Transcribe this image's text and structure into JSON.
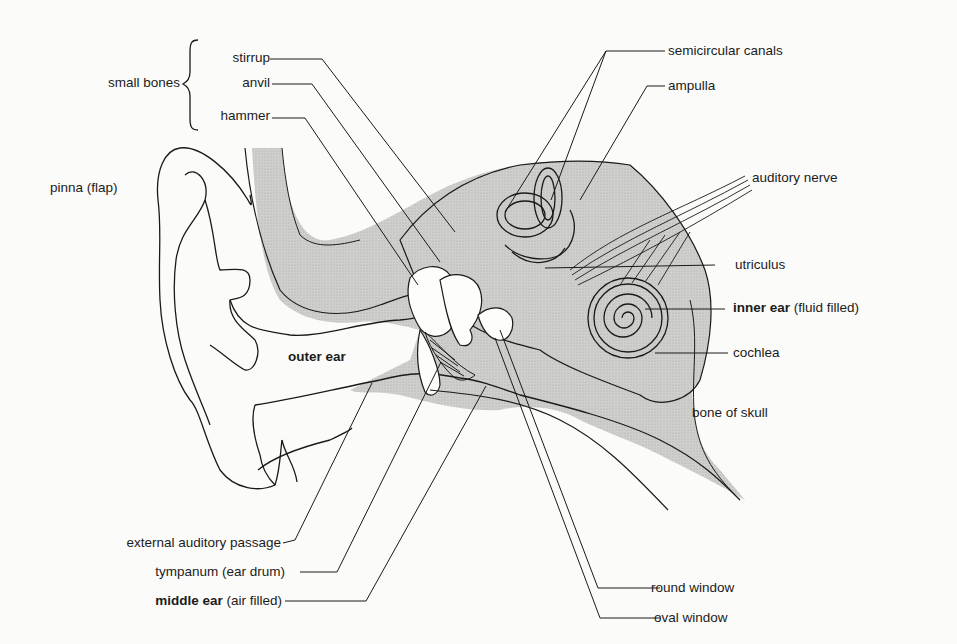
{
  "labels": {
    "small_bones": "small bones",
    "stirrup": "stirrup",
    "anvil": "anvil",
    "hammer": "hammer",
    "pinna": "pinna (flap)",
    "outer_ear": "outer ear",
    "semicircular_canals": "semicircular canals",
    "ampulla": "ampulla",
    "auditory_nerve": "auditory nerve",
    "utriculus": "utriculus",
    "inner_ear_bold": "inner ear",
    "inner_ear_rest": " (fluid filled)",
    "cochlea": "cochlea",
    "bone_of_skull": "bone of skull",
    "external_auditory_passage": "external auditory passage",
    "tympanum": "tympanum (ear drum)",
    "middle_ear_bold": "middle ear",
    "middle_ear_rest": " (air filled)",
    "round_window": "round window",
    "oval_window": "oval window"
  },
  "colors": {
    "ink": "#1a1a1a",
    "bone_shade": "#c9c9c7",
    "background": "#fbfbf9"
  }
}
